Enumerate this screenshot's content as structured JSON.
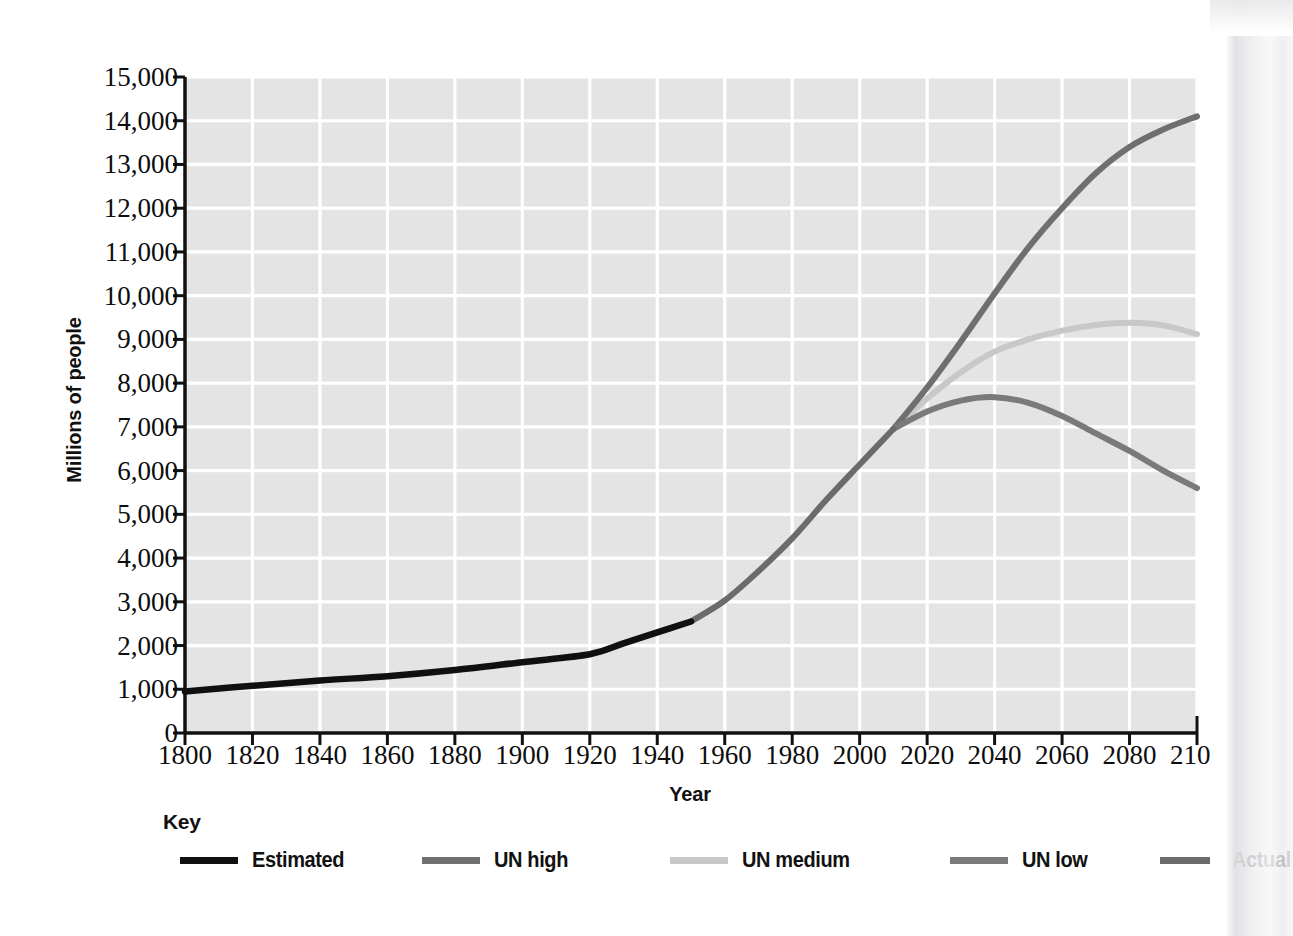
{
  "chart_data": {
    "type": "line",
    "title": "",
    "xlabel": "Year",
    "ylabel": "Millions of people",
    "xlim": [
      1800,
      2100
    ],
    "ylim": [
      0,
      15000
    ],
    "xticks": [
      1800,
      1820,
      1840,
      1860,
      1880,
      1900,
      1920,
      1940,
      1960,
      1980,
      2000,
      2020,
      2040,
      2060,
      2080,
      2100
    ],
    "yticks": [
      0,
      1000,
      2000,
      3000,
      4000,
      5000,
      6000,
      7000,
      8000,
      9000,
      10000,
      11000,
      12000,
      13000,
      14000,
      15000
    ],
    "ytick_labels": [
      "0",
      "1,000",
      "2,000",
      "3,000",
      "4,000",
      "5,000",
      "6,000",
      "7,000",
      "8,000",
      "9,000",
      "10,000",
      "11,000",
      "12,000",
      "13,000",
      "14,000",
      "15,000"
    ],
    "xtick_labels": [
      "1800",
      "1820",
      "1840",
      "1860",
      "1880",
      "1900",
      "1920",
      "1940",
      "1960",
      "1980",
      "2000",
      "2020",
      "2040",
      "2060",
      "2080",
      "2100"
    ],
    "grid": true,
    "grid_color": "#ffffff",
    "plot_bg": "#e4e4e4",
    "legend_position": "below",
    "legend_title": "Key",
    "series": [
      {
        "name": "Estimated",
        "color": "#101010",
        "x": [
          1800,
          1820,
          1840,
          1860,
          1880,
          1900,
          1920,
          1930,
          1940,
          1950
        ],
        "values": [
          950,
          1080,
          1200,
          1300,
          1440,
          1620,
          1800,
          2050,
          2300,
          2550
        ]
      },
      {
        "name": "Actual",
        "color": "#6b6b6b",
        "x": [
          1950,
          1960,
          1970,
          1980,
          1990,
          2000,
          2010
        ],
        "values": [
          2550,
          3030,
          3700,
          4450,
          5320,
          6140,
          6950
        ]
      },
      {
        "name": "UN high",
        "color": "#6f6f6f",
        "x": [
          2010,
          2020,
          2030,
          2040,
          2050,
          2060,
          2070,
          2080,
          2090,
          2100
        ],
        "values": [
          6950,
          7900,
          8950,
          10050,
          11100,
          12000,
          12800,
          13400,
          13800,
          14100
        ]
      },
      {
        "name": "UN medium",
        "color": "#c8c8c8",
        "x": [
          2010,
          2020,
          2030,
          2040,
          2050,
          2060,
          2070,
          2080,
          2090,
          2100
        ],
        "values": [
          6950,
          7650,
          8250,
          8720,
          9000,
          9200,
          9330,
          9380,
          9320,
          9120
        ]
      },
      {
        "name": "UN low",
        "color": "#7a7a7a",
        "x": [
          2010,
          2020,
          2030,
          2040,
          2050,
          2060,
          2070,
          2080,
          2090,
          2100
        ],
        "values": [
          6950,
          7350,
          7600,
          7680,
          7550,
          7250,
          6850,
          6450,
          6000,
          5600
        ]
      }
    ]
  },
  "legend": {
    "title": "Key",
    "items": [
      {
        "label": "Estimated",
        "color": "#101010",
        "x": 20
      },
      {
        "label": "UN high",
        "color": "#6f6f6f",
        "x": 262
      },
      {
        "label": "UN medium",
        "color": "#c8c8c8",
        "x": 510
      },
      {
        "label": "UN low",
        "color": "#7a7a7a",
        "x": 790
      },
      {
        "label": "Actual",
        "color": "#6b6b6b",
        "x": 1000
      }
    ]
  }
}
